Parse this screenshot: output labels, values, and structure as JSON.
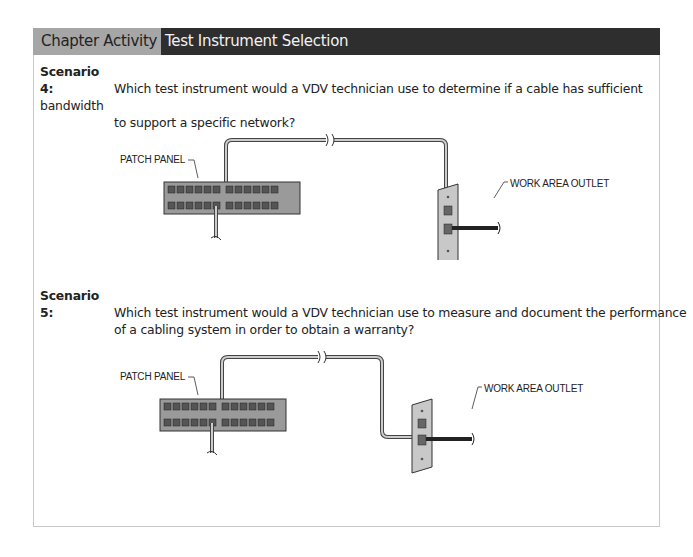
{
  "header": {
    "section_label": "Chapter Activity",
    "title": "Test Instrument Selection"
  },
  "scenarios": [
    {
      "label": "Scenario 4:",
      "question_line1": "Which test instrument would a VDV technician use to determine if a cable has sufficient bandwidth",
      "question_line2": "to support a specific network?",
      "diagram": {
        "patch_panel_label": "PATCH PANEL",
        "outlet_label": "WORK AREA OUTLET"
      }
    },
    {
      "label": "Scenario 5:",
      "question_line1": "Which test instrument would a VDV technician use to measure and document the performance",
      "question_line2": "of a cabling system in order to obtain a warranty?",
      "diagram": {
        "patch_panel_label": "PATCH PANEL",
        "outlet_label": "WORK AREA OUTLET"
      }
    }
  ],
  "colors": {
    "header_left_bg": "#a6a6a6",
    "header_right_bg": "#2e2e2e",
    "panel_fill": "#9a9a9a",
    "plate_fill": "#c8c8c8"
  }
}
